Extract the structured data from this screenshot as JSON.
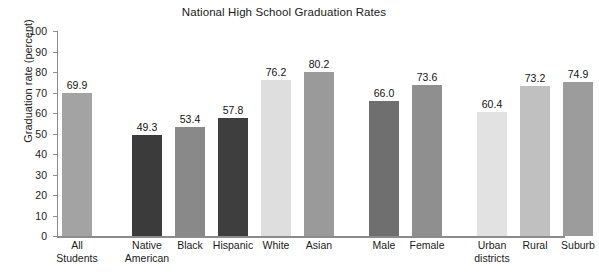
{
  "chart_data": {
    "type": "bar",
    "title": "National High School Graduation Rates",
    "xlabel": "",
    "ylabel": "Graduation rate (percent)",
    "ylim": [
      0,
      100
    ],
    "ytick_step": 10,
    "yticks": [
      "100",
      "90",
      "80",
      "70",
      "60",
      "50",
      "40",
      "30",
      "20",
      "10",
      "0"
    ],
    "grid": false,
    "legend": "none",
    "categories": [
      "All Students",
      "Native American",
      "Black",
      "Hispanic",
      "White",
      "Asian",
      "Male",
      "Female",
      "Urban districts",
      "Rural",
      "Suburb"
    ],
    "values": [
      69.9,
      49.3,
      53.4,
      57.8,
      76.2,
      80.2,
      66.0,
      73.6,
      60.4,
      73.2,
      74.9
    ],
    "value_labels": [
      "69.9",
      "49.3",
      "53.4",
      "57.8",
      "76.2",
      "80.2",
      "66.0",
      "73.6",
      "60.4",
      "73.2",
      "74.9"
    ],
    "bar_colors": [
      "#a3a3a3",
      "#3b3b3b",
      "#898989",
      "#3e3e3e",
      "#dedede",
      "#9a9a9a",
      "#6f6f6f",
      "#8f8f8f",
      "#e2e2e2",
      "#c0c0c0",
      "#9c9c9c"
    ],
    "axis_color": "#8c8c8c",
    "background": "#ffffff",
    "groups": [
      {
        "name": "overall",
        "categories": [
          "All Students"
        ]
      },
      {
        "name": "race-ethnicity",
        "categories": [
          "Native American",
          "Black",
          "Hispanic",
          "White",
          "Asian"
        ]
      },
      {
        "name": "gender",
        "categories": [
          "Male",
          "Female"
        ]
      },
      {
        "name": "locale",
        "categories": [
          "Urban districts",
          "Rural",
          "Suburb"
        ]
      }
    ]
  },
  "bars": [
    {
      "label_lines": [
        "All",
        "Students"
      ],
      "value_label": "69.9",
      "value": 69.9,
      "color": "#a3a3a3",
      "x": 5,
      "w": 30
    },
    {
      "label_lines": [
        "Native",
        "American"
      ],
      "value_label": "49.3",
      "value": 49.3,
      "color": "#3b3b3b",
      "x": 75,
      "w": 30
    },
    {
      "label_lines": [
        "Black"
      ],
      "value_label": "53.4",
      "value": 53.4,
      "color": "#898989",
      "x": 118,
      "w": 30
    },
    {
      "label_lines": [
        "Hispanic"
      ],
      "value_label": "57.8",
      "value": 57.8,
      "color": "#3e3e3e",
      "x": 161,
      "w": 30
    },
    {
      "label_lines": [
        "White"
      ],
      "value_label": "76.2",
      "value": 76.2,
      "color": "#dedede",
      "x": 204,
      "w": 30
    },
    {
      "label_lines": [
        "Asian"
      ],
      "value_label": "80.2",
      "value": 80.2,
      "color": "#9a9a9a",
      "x": 247,
      "w": 30
    },
    {
      "label_lines": [
        "Male"
      ],
      "value_label": "66.0",
      "value": 66.0,
      "color": "#6f6f6f",
      "x": 312,
      "w": 30
    },
    {
      "label_lines": [
        "Female"
      ],
      "value_label": "73.6",
      "value": 73.6,
      "color": "#8f8f8f",
      "x": 355,
      "w": 30
    },
    {
      "label_lines": [
        "Urban",
        "districts"
      ],
      "value_label": "60.4",
      "value": 60.4,
      "color": "#e2e2e2",
      "x": 420,
      "w": 30
    },
    {
      "label_lines": [
        "Rural"
      ],
      "value_label": "73.2",
      "value": 73.2,
      "color": "#c0c0c0",
      "x": 463,
      "w": 30
    },
    {
      "label_lines": [
        "Suburb"
      ],
      "value_label": "74.9",
      "value": 74.9,
      "color": "#9c9c9c",
      "x": 506,
      "w": 30
    }
  ]
}
